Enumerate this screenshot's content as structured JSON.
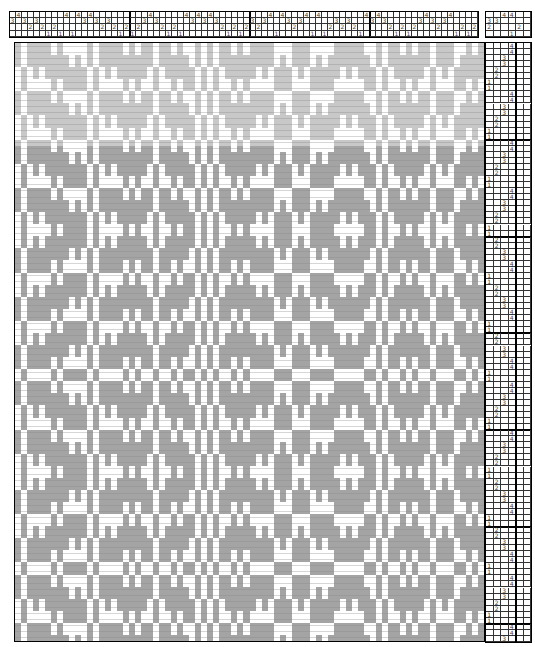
{
  "colors": {
    "weft_upper": "#c8c8c8",
    "weft_lower": "#a4a4a4",
    "weft_line": "#8a8a8a",
    "warp": "#ffffff",
    "grid_line": "#333333",
    "border": "#000000"
  },
  "layout": {
    "threading": {
      "x": 9,
      "y": 11,
      "cell_w": 6,
      "cell_h": 6.2,
      "shafts": 4
    },
    "tieup": {
      "x": 485,
      "y": 11,
      "cell_w": 7.5,
      "cell_h": 6.2,
      "cols": 6,
      "rows": 4
    },
    "drawdown": {
      "x": 14,
      "y": 42,
      "w": 469,
      "h": 598
    },
    "treadling": {
      "x": 485,
      "y": 42,
      "cell_w": 7.5,
      "cell_h": 6.05,
      "cols": 6
    },
    "upper_rows": 17
  },
  "threading": {
    "ends": 78,
    "sequence": [
      3,
      4,
      3,
      2,
      3,
      2,
      1,
      2,
      1,
      4,
      1,
      4,
      3,
      4,
      3,
      2,
      3,
      2,
      1,
      2,
      1,
      2,
      3,
      4,
      3,
      2,
      1,
      2,
      1,
      4,
      3,
      4,
      3,
      4,
      3,
      2,
      1,
      2,
      1,
      2,
      3,
      2,
      3,
      4,
      1,
      4,
      3,
      2,
      3,
      4,
      1,
      4,
      1,
      2,
      3,
      2,
      3,
      2,
      1,
      4,
      3,
      4,
      3,
      2,
      1,
      2,
      1,
      2,
      3,
      4,
      3,
      2,
      3,
      4,
      1,
      2,
      1,
      2
    ]
  },
  "tieup": {
    "rows": [
      [
        0,
        0,
        4,
        4,
        0,
        0
      ],
      [
        3,
        3,
        0,
        0,
        0,
        0
      ],
      [
        2,
        0,
        0,
        0,
        2,
        0
      ],
      [
        0,
        0,
        0,
        1,
        0,
        0
      ]
    ]
  },
  "treadling": {
    "picks": 99,
    "sequence": [
      4,
      4,
      3,
      3,
      2,
      2,
      1,
      1,
      4,
      4,
      3,
      3,
      2,
      2,
      1,
      1,
      4,
      4,
      3,
      3,
      2,
      2,
      1,
      1,
      4,
      4,
      3,
      3,
      2,
      2,
      1,
      1,
      2,
      2,
      3,
      3,
      4,
      4,
      1,
      1,
      2,
      2,
      3,
      3,
      4,
      4,
      1,
      1,
      2,
      2,
      3,
      3,
      4,
      4,
      1,
      1,
      4,
      4,
      3,
      3,
      2,
      2,
      1,
      1,
      4,
      4,
      3,
      3,
      2,
      2,
      1,
      1,
      2,
      2,
      3,
      3,
      4,
      4,
      1,
      1,
      2,
      2,
      3,
      3,
      4,
      4,
      1,
      1,
      4,
      4,
      3,
      3,
      2,
      2,
      1,
      1,
      4,
      4,
      3
    ]
  }
}
